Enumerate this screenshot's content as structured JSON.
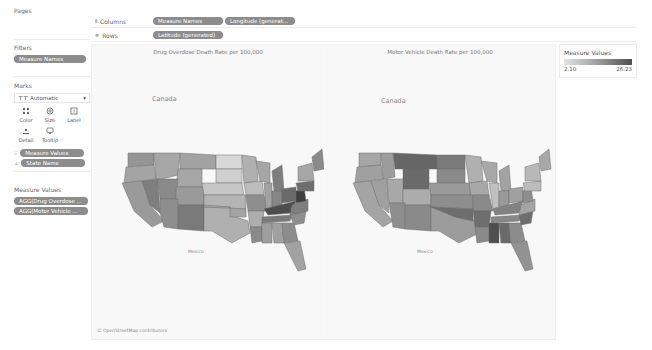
{
  "pages": {
    "title": "Pages"
  },
  "shelves": {
    "columns": {
      "label": "Columns",
      "icon": "columns-icon",
      "pills": [
        "Measure Names",
        "Longitude (generate..."
      ]
    },
    "rows": {
      "label": "Rows",
      "icon": "rows-icon",
      "pills": [
        "Latitude (generated)"
      ]
    }
  },
  "filters": {
    "title": "Filters",
    "pills": [
      "Measure Names"
    ]
  },
  "marks": {
    "title": "Marks",
    "type": "Automatic",
    "buttons": [
      {
        "label": "Color",
        "icon": "color-icon"
      },
      {
        "label": "Size",
        "icon": "size-icon"
      },
      {
        "label": "Label",
        "icon": "label-icon"
      },
      {
        "label": "Detail",
        "icon": "detail-icon"
      },
      {
        "label": "Tooltip",
        "icon": "tooltip-icon"
      }
    ],
    "pills": [
      {
        "icon": "color-icon",
        "label": "Measure Values"
      },
      {
        "icon": "detail-icon",
        "label": "State Name"
      }
    ]
  },
  "measure_values": {
    "title": "Measure Values",
    "pills": [
      "AGG(Drug Overdose ...",
      "AGG(Motor Vehicle ..."
    ]
  },
  "maps": [
    {
      "title": "Drug Overdose Death Rate per 100,000",
      "country_north": "Canada",
      "country_south": "Mexico"
    },
    {
      "title": "Motor Vehicle Death Rate per 100,000",
      "country_north": "Canada",
      "country_south": "Mexico"
    }
  ],
  "attribution": "© OpenStreetMap contributors",
  "legend": {
    "title": "Measure Values",
    "min": "2.10",
    "max": "26.23",
    "colors": {
      "low": "#e4e4e4",
      "high": "#4e4e4e"
    }
  },
  "colors": {
    "pill": "#8c8c8c",
    "map_bg": "#f8f8f8",
    "state_border": "#6e6e6e"
  }
}
